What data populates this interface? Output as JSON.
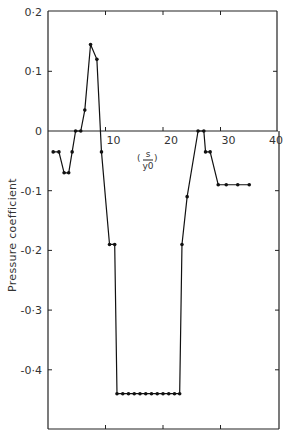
{
  "chart_data": {
    "type": "line",
    "title": "",
    "xlabel_num": "s",
    "xlabel_den": "y0",
    "xlabel": "(s/y0)",
    "ylabel": "Pressure coefficient",
    "xlim": [
      0,
      40
    ],
    "ylim": [
      -0.5,
      0.2
    ],
    "grid": false,
    "x_ticks": [
      10,
      20,
      30,
      40
    ],
    "x_tick_labels": [
      "10",
      "20",
      "30",
      "40"
    ],
    "y_ticks": [
      0.2,
      0.1,
      0,
      -0.1,
      -0.2,
      -0.3,
      -0.4
    ],
    "y_tick_labels": [
      "0·2",
      "0·1",
      "0",
      "-0·1",
      "-0·2",
      "-0·3",
      "-0·4"
    ],
    "series": [
      {
        "name": "pressure coefficient",
        "x": [
          0.9,
          1.9,
          2.8,
          3.6,
          4.2,
          4.8,
          5.7,
          6.4,
          7.4,
          8.5,
          9.3,
          10.7,
          11.6,
          12.0,
          13.0,
          14.0,
          15.0,
          16.0,
          17.0,
          18.0,
          19.0,
          20.0,
          21.0,
          22.0,
          22.9,
          23.3,
          24.2,
          26.1,
          27.1,
          27.4,
          28.2,
          29.6,
          31.0,
          33.0,
          35.0
        ],
        "y": [
          -0.035,
          -0.035,
          -0.07,
          -0.07,
          -0.035,
          0,
          0,
          0.035,
          0.145,
          0.12,
          -0.035,
          -0.19,
          -0.19,
          -0.44,
          -0.44,
          -0.44,
          -0.44,
          -0.44,
          -0.44,
          -0.44,
          -0.44,
          -0.44,
          -0.44,
          -0.44,
          -0.44,
          -0.19,
          -0.11,
          0,
          0,
          -0.035,
          -0.035,
          -0.09,
          -0.09,
          -0.09,
          -0.09
        ]
      }
    ]
  }
}
